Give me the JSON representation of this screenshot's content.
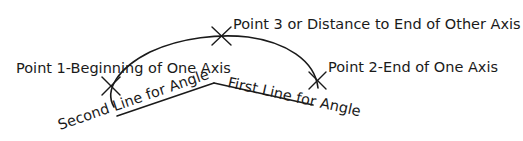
{
  "diagram": {
    "colors": {
      "ink": "#1a1a1a",
      "background": "#ffffff"
    },
    "points": [
      {
        "id": "point1",
        "label": "Point 1-Beginning of One Axis",
        "marker": "x-mark"
      },
      {
        "id": "point2",
        "label": "Point 2-End of One Axis",
        "marker": "x-mark"
      },
      {
        "id": "point3",
        "label": "Point 3 or Distance to End of Other Axis",
        "marker": "x-mark"
      }
    ],
    "lines": [
      {
        "id": "first-line",
        "label": "First Line for Angle"
      },
      {
        "id": "second-line",
        "label": "Second Line for Angle"
      }
    ]
  }
}
